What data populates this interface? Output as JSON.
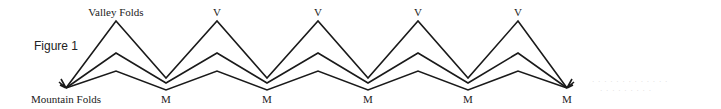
{
  "figure": {
    "label": "Figure 1",
    "top_label": "Valley Folds",
    "bottom_label": "Mountain Folds",
    "valley_marker": "V",
    "mountain_marker": "M",
    "valley_markers": [
      "V",
      "V",
      "V",
      "V"
    ],
    "mountain_markers": [
      "M",
      "M",
      "M",
      "M",
      "M"
    ],
    "line_color": "#1a1a1a",
    "faint_text_1": "· · · · · · · · · · · · ·",
    "faint_text_2": "· · · · ·   · · · ·"
  }
}
